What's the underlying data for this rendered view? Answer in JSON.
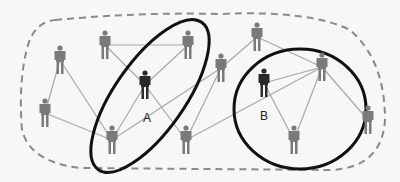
{
  "diagram": {
    "type": "social-network",
    "colors": {
      "background": "#f7f7f7",
      "edge": "#a8a8a8",
      "person": "#7a7a7a",
      "person_highlight": "#2a2a2a",
      "group_outline": "#111111",
      "boundary": "#8a8a8a"
    },
    "nodes": [
      {
        "id": "n1",
        "x": 105,
        "y": 45,
        "highlight": false
      },
      {
        "id": "n2",
        "x": 188,
        "y": 45,
        "highlight": false
      },
      {
        "id": "n3",
        "x": 60,
        "y": 60,
        "highlight": false
      },
      {
        "id": "n4",
        "x": 45,
        "y": 113,
        "highlight": false
      },
      {
        "id": "A",
        "x": 145,
        "y": 85,
        "highlight": true,
        "label": "A"
      },
      {
        "id": "n6",
        "x": 112,
        "y": 140,
        "highlight": false
      },
      {
        "id": "n7",
        "x": 186,
        "y": 140,
        "highlight": false
      },
      {
        "id": "n8",
        "x": 221,
        "y": 68,
        "highlight": false
      },
      {
        "id": "n9",
        "x": 257,
        "y": 37,
        "highlight": false
      },
      {
        "id": "B",
        "x": 264,
        "y": 83,
        "highlight": true,
        "label": "B"
      },
      {
        "id": "n11",
        "x": 322,
        "y": 67,
        "highlight": false
      },
      {
        "id": "n12",
        "x": 294,
        "y": 140,
        "highlight": false
      },
      {
        "id": "n13",
        "x": 368,
        "y": 120,
        "highlight": false
      }
    ],
    "edges": [
      [
        "n1",
        "n2"
      ],
      [
        "n1",
        "A"
      ],
      [
        "n2",
        "A"
      ],
      [
        "n3",
        "n4"
      ],
      [
        "n3",
        "n6"
      ],
      [
        "n4",
        "n6"
      ],
      [
        "n6",
        "A"
      ],
      [
        "A",
        "n7"
      ],
      [
        "n7",
        "n8"
      ],
      [
        "n7",
        "n11"
      ],
      [
        "n8",
        "n9"
      ],
      [
        "n9",
        "n11"
      ],
      [
        "B",
        "n11"
      ],
      [
        "B",
        "n12"
      ],
      [
        "n11",
        "n12"
      ],
      [
        "n11",
        "n13"
      ],
      [
        "n6",
        "n8"
      ]
    ],
    "groups": [
      {
        "name": "group-A",
        "cx": 150,
        "cy": 96,
        "rx": 35,
        "ry": 90,
        "rotate": 35
      },
      {
        "name": "group-B",
        "cx": 300,
        "cy": 109,
        "rx": 66,
        "ry": 60,
        "rotate": 0
      }
    ],
    "labels": {
      "a": "A",
      "b": "B"
    }
  }
}
